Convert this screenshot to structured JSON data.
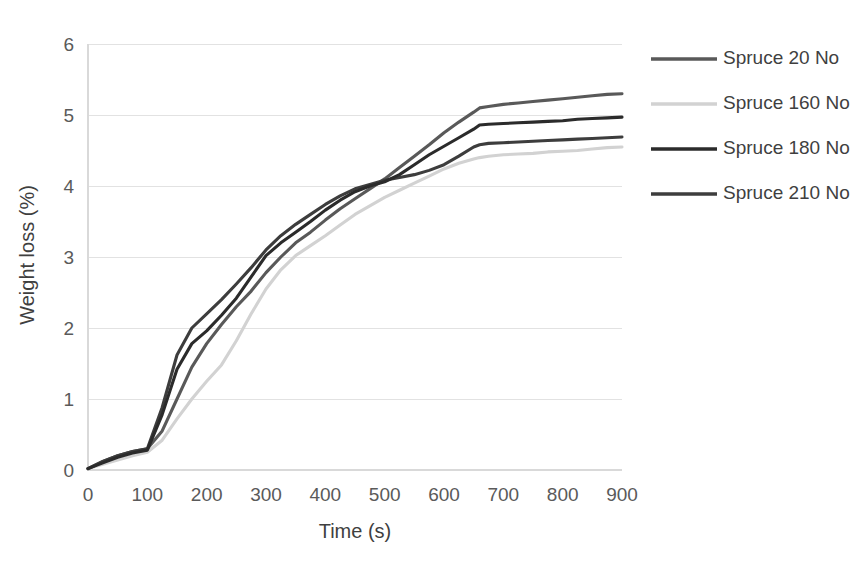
{
  "chart_data": {
    "type": "line",
    "title": "",
    "xlabel": "Time (s)",
    "ylabel": "Weight loss (%)",
    "xlim": [
      0,
      900
    ],
    "ylim": [
      0,
      6
    ],
    "xticks": [
      0,
      100,
      200,
      300,
      400,
      500,
      600,
      700,
      800,
      900
    ],
    "yticks": [
      0,
      1,
      2,
      3,
      4,
      5,
      6
    ],
    "xtick_labels": [
      "0",
      "100",
      "200",
      "300",
      "400",
      "500",
      "600",
      "700",
      "800",
      "900"
    ],
    "ytick_labels": [
      "0",
      "1",
      "2",
      "3",
      "4",
      "5",
      "6"
    ],
    "grid": "horizontal",
    "legend_position": "right",
    "x": [
      0,
      25,
      50,
      75,
      100,
      125,
      150,
      175,
      200,
      225,
      250,
      275,
      300,
      325,
      350,
      375,
      400,
      425,
      450,
      475,
      500,
      525,
      550,
      575,
      600,
      625,
      650,
      660,
      675,
      700,
      725,
      750,
      775,
      800,
      825,
      850,
      875,
      900
    ],
    "series": [
      {
        "name": "Spruce 20 No",
        "color": "#595959",
        "values": [
          0.02,
          0.12,
          0.2,
          0.26,
          0.3,
          0.55,
          1.0,
          1.45,
          1.78,
          2.05,
          2.3,
          2.52,
          2.78,
          3.0,
          3.2,
          3.35,
          3.52,
          3.68,
          3.82,
          3.96,
          4.1,
          4.26,
          4.42,
          4.58,
          4.75,
          4.9,
          5.04,
          5.1,
          5.12,
          5.15,
          5.17,
          5.19,
          5.21,
          5.23,
          5.25,
          5.27,
          5.29,
          5.3
        ]
      },
      {
        "name": "Spruce 160 No",
        "color": "#d2d2d2",
        "values": [
          0.02,
          0.08,
          0.14,
          0.2,
          0.25,
          0.42,
          0.72,
          1.0,
          1.25,
          1.48,
          1.82,
          2.2,
          2.55,
          2.82,
          3.02,
          3.16,
          3.3,
          3.45,
          3.6,
          3.72,
          3.84,
          3.94,
          4.04,
          4.14,
          4.24,
          4.32,
          4.38,
          4.4,
          4.42,
          4.44,
          4.45,
          4.46,
          4.48,
          4.49,
          4.5,
          4.52,
          4.54,
          4.55
        ]
      },
      {
        "name": "Spruce 180 No",
        "color": "#2b2b2b",
        "values": [
          0.02,
          0.1,
          0.18,
          0.24,
          0.28,
          0.78,
          1.42,
          1.78,
          1.96,
          2.18,
          2.42,
          2.72,
          3.02,
          3.2,
          3.35,
          3.5,
          3.66,
          3.8,
          3.92,
          4.0,
          4.06,
          4.16,
          4.3,
          4.44,
          4.56,
          4.68,
          4.8,
          4.86,
          4.87,
          4.88,
          4.89,
          4.9,
          4.91,
          4.92,
          4.94,
          4.95,
          4.96,
          4.97
        ]
      },
      {
        "name": "Spruce 210 No",
        "color": "#3d3d3d",
        "values": [
          0.02,
          0.12,
          0.2,
          0.26,
          0.3,
          0.88,
          1.62,
          2.0,
          2.2,
          2.4,
          2.62,
          2.85,
          3.1,
          3.3,
          3.46,
          3.6,
          3.74,
          3.86,
          3.96,
          4.02,
          4.08,
          4.12,
          4.16,
          4.22,
          4.3,
          4.42,
          4.55,
          4.58,
          4.6,
          4.61,
          4.62,
          4.63,
          4.64,
          4.65,
          4.66,
          4.67,
          4.68,
          4.69
        ]
      }
    ]
  },
  "legend": {
    "entries": [
      {
        "label": "Spruce 20 No",
        "color": "#595959"
      },
      {
        "label": "Spruce 160 No",
        "color": "#d2d2d2"
      },
      {
        "label": "Spruce 180 No",
        "color": "#2b2b2b"
      },
      {
        "label": "Spruce 210 No",
        "color": "#3d3d3d"
      }
    ]
  },
  "axes": {
    "x_title": "Time (s)",
    "y_title": "Weight loss (%)"
  }
}
